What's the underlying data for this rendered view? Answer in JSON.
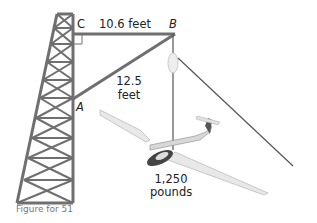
{
  "figure": {
    "caption": "Figure for 51",
    "points": {
      "A": "A",
      "B": "B",
      "C": "C"
    },
    "labels": {
      "cb_length": "10.6 feet",
      "ab_length_num": "12.5",
      "ab_length_unit": "feet",
      "weight_num": "1,250",
      "weight_unit": "pounds"
    },
    "elements": [
      "lattice-tower",
      "horizontal-beam",
      "diagonal-brace",
      "pulley",
      "cable",
      "glider"
    ],
    "colors": {
      "structure": "#6a6a6a",
      "text": "#222222",
      "caption": "#777777"
    }
  }
}
